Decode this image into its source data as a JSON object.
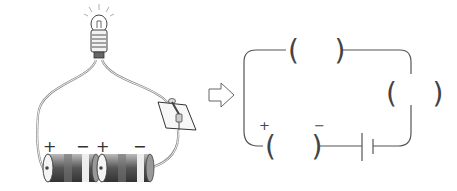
{
  "left_picture": {
    "description": "Physical circuit: light bulb, switch on board, two batteries in series",
    "battery_1": {
      "plus": "+",
      "minus": "−"
    },
    "battery_2": {
      "plus": "+",
      "minus": "−"
    }
  },
  "arrow": {
    "icon": "right-arrow-outline"
  },
  "right_schematic": {
    "blank_top": "(    )",
    "blank_right": "(    )",
    "blank_bottom_left": "(    )",
    "plus_label": "+",
    "minus_label": "−"
  },
  "colors": {
    "line": "#555555",
    "battery_dark": "#4a4a4a",
    "battery_mid": "#8a8a8a",
    "battery_light": "#e8e8e8"
  }
}
